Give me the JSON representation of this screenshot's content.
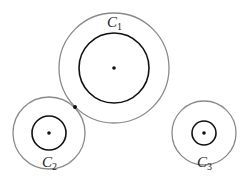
{
  "diagram": {
    "colors": {
      "outer_circle": "#8a8a8a",
      "inner_circle": "#111111",
      "background": "#ffffff"
    },
    "circles": [
      {
        "id": "C1",
        "label": "C",
        "subscript": "1",
        "cx": 114,
        "cy": 68,
        "r_inner": 35,
        "r_outer": 55,
        "label_x": 107,
        "label_y": 27
      },
      {
        "id": "C2",
        "label": "C",
        "subscript": "2",
        "cx": 49,
        "cy": 133,
        "r_inner": 17,
        "r_outer": 36,
        "label_x": 42,
        "label_y": 167
      },
      {
        "id": "C3",
        "label": "C",
        "subscript": "3",
        "cx": 204,
        "cy": 133,
        "r_inner": 12,
        "r_outer": 32,
        "label_x": 197,
        "label_y": 167
      }
    ],
    "tangent_point": {
      "x": 75,
      "y": 107,
      "between": [
        "C1",
        "C2"
      ]
    }
  }
}
